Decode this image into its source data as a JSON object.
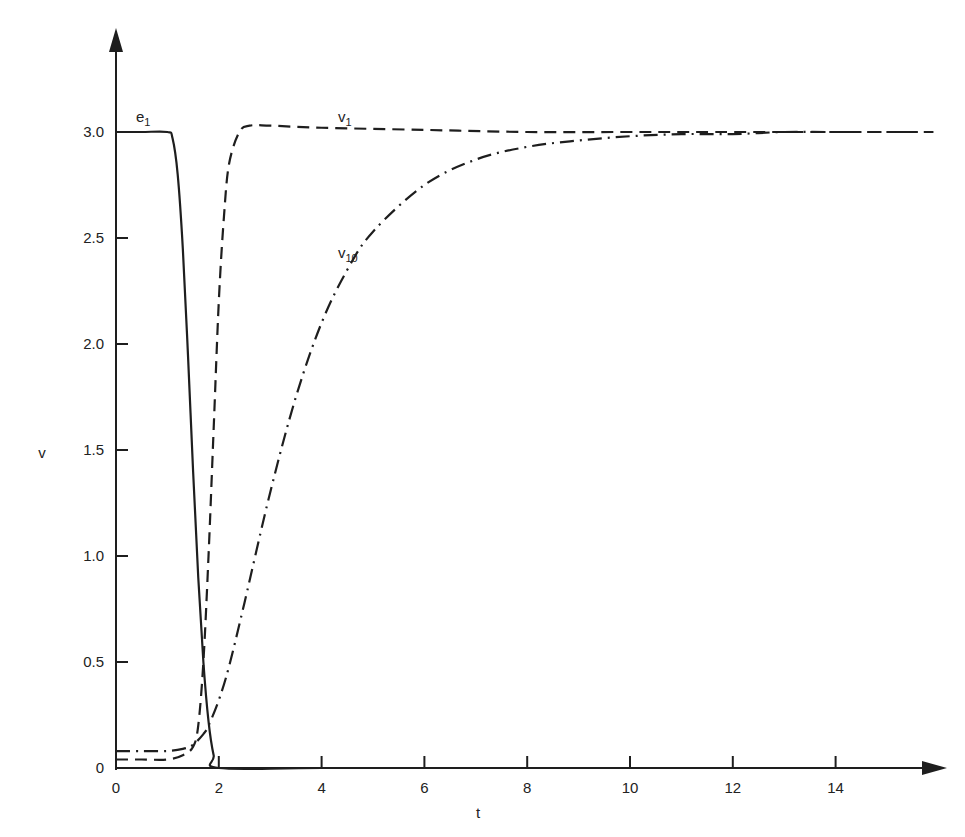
{
  "chart_data": {
    "type": "line",
    "title": "",
    "xlabel": "t",
    "ylabel": "v",
    "xlim": [
      0,
      16
    ],
    "ylim": [
      0,
      3.5
    ],
    "grid": false,
    "legend": "inline labels",
    "x_ticks": [
      0,
      2,
      4,
      6,
      8,
      10,
      12,
      14
    ],
    "x_tick_labels": [
      "0",
      "2",
      "4",
      "6",
      "8",
      "10",
      "12",
      "14"
    ],
    "y_ticks": [
      0,
      0.5,
      1.0,
      1.5,
      2.0,
      2.5,
      3.0
    ],
    "y_tick_labels": [
      "0",
      "0.5",
      "1.0",
      "1.5",
      "2.0",
      "2.5",
      "3.0"
    ],
    "series": [
      {
        "name": "e1",
        "label_main": "e",
        "label_sub": "1",
        "style": "solid",
        "x": [
          0,
          0.5,
          1.0,
          1.1,
          1.2,
          1.3,
          1.4,
          1.5,
          1.6,
          1.7,
          1.8,
          1.9,
          2.0,
          4,
          8,
          12,
          16
        ],
        "y": [
          3.0,
          3.0,
          3.0,
          2.97,
          2.8,
          2.45,
          1.95,
          1.4,
          0.9,
          0.5,
          0.22,
          0.06,
          0,
          0,
          0,
          0,
          0
        ]
      },
      {
        "name": "v1",
        "label_main": "v",
        "label_sub": "1",
        "style": "dashed",
        "x": [
          0,
          0.5,
          1.0,
          1.3,
          1.5,
          1.6,
          1.7,
          1.8,
          1.9,
          2.0,
          2.1,
          2.2,
          2.4,
          2.6,
          3.0,
          4,
          6,
          8,
          10,
          12,
          16
        ],
        "y": [
          0.04,
          0.04,
          0.04,
          0.06,
          0.1,
          0.2,
          0.5,
          1.0,
          1.6,
          2.2,
          2.6,
          2.85,
          3.0,
          3.03,
          3.03,
          3.02,
          3.01,
          3.0,
          3.0,
          3.0,
          3.0
        ]
      },
      {
        "name": "v10",
        "label_main": "v",
        "label_sub": "10",
        "style": "dashdot",
        "x": [
          0,
          0.5,
          1.0,
          1.3,
          1.5,
          1.7,
          1.8,
          2.0,
          2.2,
          2.5,
          3.0,
          3.5,
          4.0,
          4.5,
          5.0,
          6.0,
          7.0,
          8.0,
          9.0,
          10.0,
          11.0,
          12.0,
          13.0,
          14.0,
          16.0
        ],
        "y": [
          0.08,
          0.08,
          0.08,
          0.09,
          0.11,
          0.16,
          0.2,
          0.32,
          0.48,
          0.78,
          1.3,
          1.75,
          2.1,
          2.35,
          2.53,
          2.75,
          2.87,
          2.93,
          2.96,
          2.98,
          2.99,
          2.99,
          3.0,
          3.0,
          3.0
        ]
      }
    ],
    "annotations": [
      {
        "text": "e1",
        "x": 0.85,
        "y": 3.1
      },
      {
        "text": "v1",
        "x": 4.6,
        "y": 3.1
      },
      {
        "text": "v10",
        "x": 4.6,
        "y": 2.48
      }
    ]
  },
  "layout": {
    "origin_px": [
      116,
      768
    ],
    "px_per_x": 51.4,
    "px_per_y": 212,
    "stroke_color": "#1e1e1e"
  }
}
